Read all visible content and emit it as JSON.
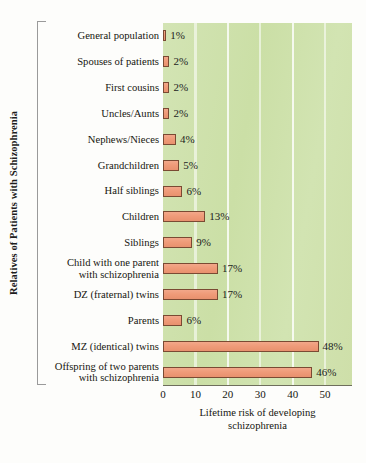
{
  "chart_data": {
    "type": "bar",
    "orientation": "horizontal",
    "title": "",
    "xlabel": "Lifetime risk of developing schizophrenia",
    "xlabel_lines": [
      "Lifetime risk of developing",
      "schizophrenia"
    ],
    "ylabel": "Relatives of Patients with Schizophrenia",
    "xlim": [
      0,
      58.3
    ],
    "xticks": [
      0,
      10,
      20,
      30,
      40,
      50
    ],
    "xtick_labels": [
      "0",
      "10",
      "20",
      "30",
      "40",
      "50"
    ],
    "grid": "vertical-white",
    "legend": "none",
    "value_suffix": "%",
    "categories": [
      "General population",
      "Spouses of patients",
      "First cousins",
      "Uncles/Aunts",
      "Nephews/Nieces",
      "Grandchildren",
      "Half siblings",
      "Children",
      "Siblings",
      "Child with one parent with schizophrenia",
      "DZ (fraternal) twins",
      "Parents",
      "MZ (identical) twins",
      "Offspring of two parents with schizophrenia"
    ],
    "category_lines": [
      [
        "General population"
      ],
      [
        "Spouses of patients"
      ],
      [
        "First cousins"
      ],
      [
        "Uncles/Aunts"
      ],
      [
        "Nephews/Nieces"
      ],
      [
        "Grandchildren"
      ],
      [
        "Half siblings"
      ],
      [
        "Children"
      ],
      [
        "Siblings"
      ],
      [
        "Child with one parent",
        "with schizophrenia"
      ],
      [
        "DZ (fraternal) twins"
      ],
      [
        "Parents"
      ],
      [
        "MZ (identical) twins"
      ],
      [
        "Offspring of two parents",
        "with schizophrenia"
      ]
    ],
    "values": [
      1,
      2,
      2,
      2,
      4,
      5,
      6,
      13,
      9,
      17,
      17,
      6,
      48,
      46
    ],
    "value_labels": [
      "1%",
      "2%",
      "2%",
      "2%",
      "4%",
      "5%",
      "6%",
      "13%",
      "9%",
      "17%",
      "17%",
      "6%",
      "48%",
      "46%"
    ]
  },
  "colors": {
    "bar_fill": "#ef9b79",
    "bar_stroke": "#7a4a33",
    "plot_background": "#cfe1ab",
    "gridline": "#ffffff",
    "text": "#16160f",
    "axis": "#6e6e5c"
  }
}
